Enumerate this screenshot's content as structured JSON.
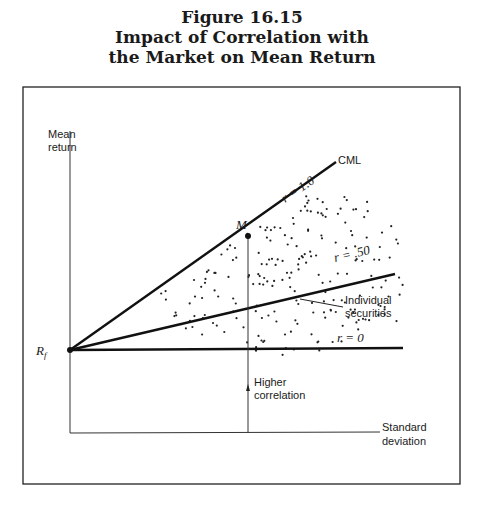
{
  "figure": {
    "number": "Figure 16.15",
    "title_line1": "Impact of Correlation with",
    "title_line2": "the Market on Mean Return"
  },
  "chart_data": {
    "type": "line",
    "xlabel": "Standard deviation",
    "ylabel": "Mean return",
    "grid": false,
    "series": [
      {
        "name": "CML",
        "label": "r = 1.0",
        "from": "Rf",
        "slope": "steepest"
      },
      {
        "name": "r = .50",
        "label": "r = .50",
        "from": "Rf",
        "slope": "moderate"
      },
      {
        "name": "r = 0",
        "label": "r = 0",
        "from": "Rf",
        "slope": "flat"
      }
    ],
    "points": [
      {
        "name": "Rf",
        "label": "Rf",
        "location": "y-axis intercept"
      },
      {
        "name": "M",
        "label": "M",
        "location": "on CML"
      }
    ],
    "annotations": [
      "CML",
      "r = 1.0",
      "r = .50",
      "r = 0",
      "Individual securities",
      "Higher correlation"
    ]
  },
  "labels": {
    "y_axis_line1": "Mean",
    "y_axis_line2": "return",
    "x_axis_line1": "Standard",
    "x_axis_line2": "deviation",
    "cml": "CML",
    "r1": "r = 1.0",
    "r50": "r = .50",
    "r0": "r = 0",
    "m": "M",
    "rf": "R",
    "rf_sub": "f",
    "securities_line1": "Individual",
    "securities_line2": "securities",
    "higher_line1": "Higher",
    "higher_line2": "correlation"
  }
}
